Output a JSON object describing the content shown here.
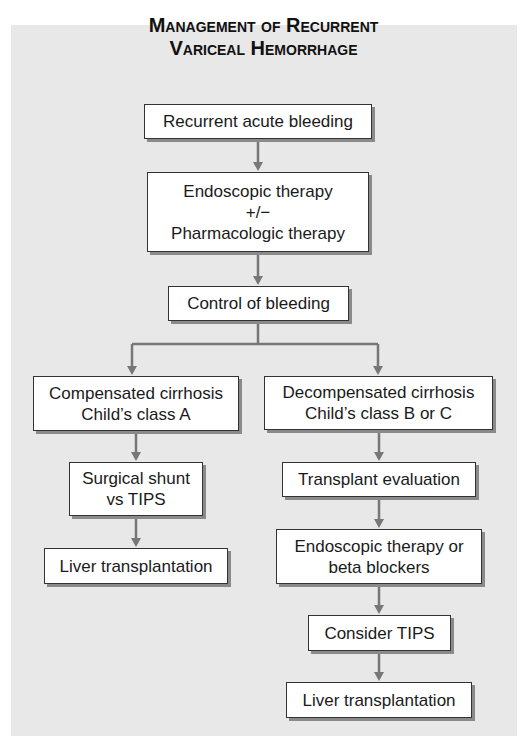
{
  "title": {
    "line1": "Management of Recurrent",
    "line2": "Variceal Hemorrhage"
  },
  "colors": {
    "panel_bg": "#e8e8e8",
    "box_bg": "#ffffff",
    "box_border": "#333333",
    "connector": "#777777"
  },
  "nodes": {
    "recurrent_bleeding": {
      "lines": [
        "Recurrent acute bleeding"
      ]
    },
    "initial_therapy": {
      "lines": [
        "Endoscopic therapy",
        "+/−",
        "Pharmacologic therapy"
      ]
    },
    "control": {
      "lines": [
        "Control of bleeding"
      ]
    },
    "compensated": {
      "lines": [
        "Compensated cirrhosis",
        "Child’s class A"
      ]
    },
    "decompensated": {
      "lines": [
        "Decompensated cirrhosis",
        "Child’s class B or C"
      ]
    },
    "shunt": {
      "lines": [
        "Surgical shunt",
        "vs TIPS"
      ]
    },
    "liver_left": {
      "lines": [
        "Liver transplantation"
      ]
    },
    "transplant_eval": {
      "lines": [
        "Transplant evaluation"
      ]
    },
    "endo_beta": {
      "lines": [
        "Endoscopic therapy or",
        "beta blockers"
      ]
    },
    "consider_tips": {
      "lines": [
        "Consider TIPS"
      ]
    },
    "liver_right": {
      "lines": [
        "Liver transplantation"
      ]
    }
  },
  "edges": [
    [
      "recurrent_bleeding",
      "initial_therapy"
    ],
    [
      "initial_therapy",
      "control"
    ],
    [
      "control",
      "compensated"
    ],
    [
      "control",
      "decompensated"
    ],
    [
      "compensated",
      "shunt"
    ],
    [
      "shunt",
      "liver_left"
    ],
    [
      "decompensated",
      "transplant_eval"
    ],
    [
      "transplant_eval",
      "endo_beta"
    ],
    [
      "endo_beta",
      "consider_tips"
    ],
    [
      "consider_tips",
      "liver_right"
    ]
  ]
}
